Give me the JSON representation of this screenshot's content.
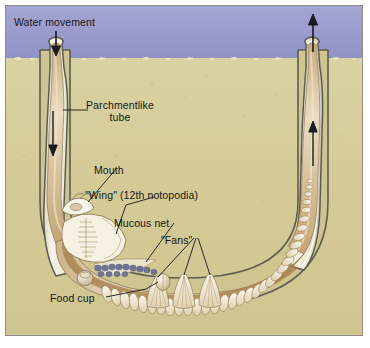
{
  "figure": {
    "view": "cutaway side view of U-shaped parchmentlike tube buried in sand beneath water"
  },
  "environment": {
    "water_label": "Water movement",
    "water_color": "#9b9ccd",
    "sand_color": "#d5cd9a",
    "sand_surface_y": 57,
    "frame_color": "#8e8c84",
    "page_background": "#ffffff"
  },
  "labels": [
    {
      "id": "water-movement",
      "text": "Water movement"
    },
    {
      "id": "parchmentlike-tube",
      "line1": "Parchmentlike",
      "line2": "tube"
    },
    {
      "id": "mouth",
      "text": "Mouth"
    },
    {
      "id": "wing",
      "text": "\"Wing\" (12th notopodia)"
    },
    {
      "id": "mucous-net",
      "text": "Mucous net"
    },
    {
      "id": "fans",
      "text": "\"Fans\""
    },
    {
      "id": "food-cup",
      "text": "Food cup"
    }
  ],
  "flow_arrows": [
    {
      "id": "inflow-surface-arrow",
      "direction": "down",
      "description": "water entering left tube opening"
    },
    {
      "id": "inflow-tube-arrow",
      "direction": "down",
      "description": "water flowing down inside left tube"
    },
    {
      "id": "outflow-tube-arrow",
      "direction": "up",
      "description": "water flowing up inside right tube"
    },
    {
      "id": "outflow-surface-arrow",
      "direction": "up",
      "description": "water exiting right tube opening"
    }
  ],
  "anatomy": {
    "tube": {
      "name": "parchmentlike tube",
      "color": "#f3eee1",
      "wall_color": "#6d6a5f"
    },
    "worm_body": {
      "name": "worm body",
      "color": "#e6d7b8"
    },
    "mouth": {
      "name": "mouth"
    },
    "wing": {
      "name": "wing (12th notopodia)",
      "count": 1
    },
    "mucous_net": {
      "name": "mucous net",
      "color": "#6f7495",
      "bead_count": 13
    },
    "fans": {
      "name": "fans",
      "count": 3,
      "description": "three fan-shaped notopodia that pump water"
    },
    "food_cup": {
      "name": "food cup"
    },
    "parapodia": {
      "name": "parapodia",
      "count": 34,
      "description": "repeated segmental paddles along posterior body"
    }
  },
  "colors": {
    "water": "#9b9ccd",
    "sand": "#d5cd9a",
    "tube_fill": "#f5f1e6",
    "tube_outline": "#5e5b52",
    "worm_tan": "#e2d3b2",
    "worm_shadow": "#9c7a4f",
    "net_blue": "#6f7495",
    "label_text": "#16161a",
    "leader_line": "#16161a"
  }
}
